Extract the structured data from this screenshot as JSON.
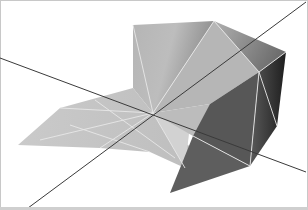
{
  "scene": {
    "description": "3D rendered folded polyhedral surface with two axis lines",
    "colors": {
      "background": "#ffffff",
      "frame": "#c8c8c8",
      "axis_line": "#3a3a3a",
      "edge_highlight": "#e6e6e6",
      "floor": "#c4c4c4",
      "back_wall_light": "#c9c9c9",
      "back_wall_dark": "#7a7a7a",
      "right_facet_dark": "#2e2e2e",
      "lower_facet": "#595959"
    }
  }
}
